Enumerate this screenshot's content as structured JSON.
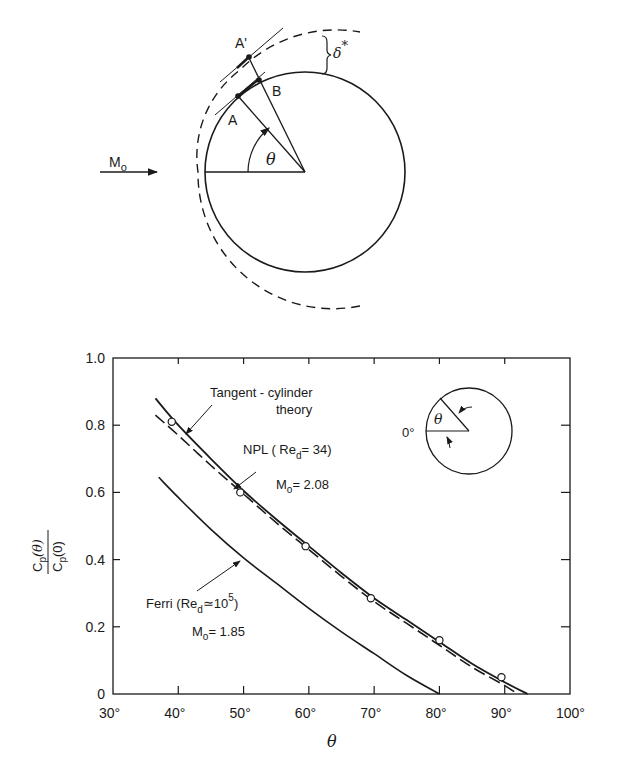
{
  "diagram": {
    "freestream_label": "M",
    "freestream_sub": "o",
    "point_A": "A",
    "point_A_prime": "A'",
    "point_B": "B",
    "angle_label": "θ",
    "displacement_label": "δ",
    "displacement_sup": "*"
  },
  "chart_data": {
    "type": "line",
    "title": "",
    "xlabel": "θ",
    "ylabel_num": "C",
    "ylabel_num_sub": "p",
    "ylabel_num_arg": "(θ)",
    "ylabel_den": "C",
    "ylabel_den_sub": "p",
    "ylabel_den_arg": "(0)",
    "xlim": [
      30,
      100
    ],
    "ylim": [
      0,
      1.0
    ],
    "grid": false,
    "x_ticks": [
      "30°",
      "40°",
      "50°",
      "60°",
      "70°",
      "80°",
      "90°",
      "100°"
    ],
    "y_ticks": [
      "0",
      "0.2",
      "0.4",
      "0.6",
      "0.8",
      "1.0"
    ],
    "series": [
      {
        "name": "Tangent-cylinder theory",
        "style": "solid",
        "x": [
          36.5,
          40,
          45,
          50,
          55,
          60,
          65,
          70,
          75,
          80,
          85,
          90,
          93.5
        ],
        "y": [
          0.88,
          0.8,
          0.7,
          0.605,
          0.52,
          0.44,
          0.36,
          0.285,
          0.22,
          0.155,
          0.09,
          0.035,
          0.0
        ]
      },
      {
        "name": "NPL (Re_d = 34), M_o = 2.08",
        "style": "dashed",
        "x": [
          36.5,
          40,
          45,
          50,
          55,
          60,
          65,
          70,
          75,
          80,
          85,
          90,
          92
        ],
        "y": [
          0.83,
          0.77,
          0.68,
          0.595,
          0.51,
          0.43,
          0.35,
          0.275,
          0.21,
          0.145,
          0.08,
          0.025,
          0.0
        ]
      },
      {
        "name": "NPL data",
        "style": "markers",
        "x": [
          39,
          49.5,
          59.5,
          69.5,
          80,
          89.5
        ],
        "y": [
          0.81,
          0.6,
          0.44,
          0.285,
          0.16,
          0.05
        ]
      },
      {
        "name": "Ferri (Re_d ≃ 10^5), M_o = 1.85",
        "style": "solid",
        "x": [
          37,
          40,
          45,
          50,
          55,
          60,
          65,
          70,
          75,
          80
        ],
        "y": [
          0.645,
          0.585,
          0.49,
          0.405,
          0.33,
          0.255,
          0.185,
          0.12,
          0.055,
          0.0
        ]
      }
    ],
    "annotations": {
      "tangent_line1": "Tangent - cylinder",
      "tangent_line2": "theory",
      "npl_line1": "NPL ( Re",
      "npl_sub": "d",
      "npl_tail": "= 34)",
      "npl_mach": "M",
      "npl_mach_sub": "o",
      "npl_mach_val": "= 2.08",
      "ferri_line1": "Ferri (Re",
      "ferri_sub": "d",
      "ferri_tail": "≃10",
      "ferri_sup": "5",
      "ferri_close": ")",
      "ferri_mach": "M",
      "ferri_mach_sub": "o",
      "ferri_mach_val": "= 1.85",
      "inset_zero": "0°",
      "inset_theta": "θ"
    }
  }
}
